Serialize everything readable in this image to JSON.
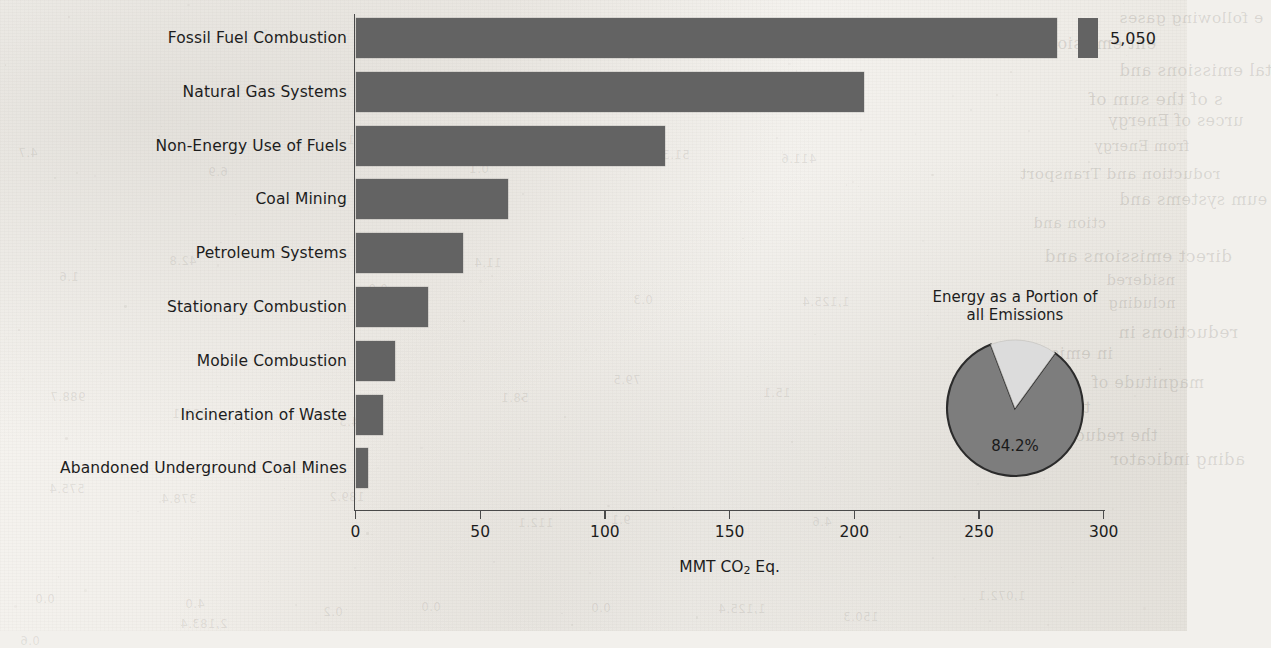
{
  "chart_data": {
    "type": "bar",
    "title": "",
    "orientation": "horizontal",
    "xlabel": "MMT CO2 Eq.",
    "xlabel_parts": {
      "pre": "MMT CO",
      "sub": "2",
      "post": " Eq."
    },
    "ylabel": "",
    "xlim": [
      0,
      300
    ],
    "xticks": [
      0,
      50,
      100,
      150,
      200,
      250,
      300
    ],
    "xtick_labels": [
      "0",
      "50",
      "100",
      "150",
      "200",
      "250",
      "300"
    ],
    "grid": false,
    "legend": "none",
    "bar_color": "#636363",
    "categories": [
      "Fossil Fuel Combustion",
      "Natural Gas Systems",
      "Non-Energy Use of Fuels",
      "Coal Mining",
      "Petroleum Systems",
      "Stationary Combustion",
      "Mobile Combustion",
      "Incineration of Waste",
      "Abandoned Underground Coal Mines"
    ],
    "values": [
      5050,
      204,
      124,
      61,
      43,
      29,
      16,
      11,
      5
    ],
    "axis_broken": true,
    "broken_bar_index": 0,
    "value_labels": [
      {
        "category": "Fossil Fuel Combustion",
        "label": "5,050"
      }
    ]
  },
  "inset_pie": {
    "type": "pie",
    "title_line1": "Energy as a Portion of",
    "title_line2": "all Emissions",
    "slices": [
      {
        "name": "Energy",
        "value": 84.2,
        "label": "84.2%",
        "color": "#7d7d7d"
      },
      {
        "name": "Other",
        "value": 15.8,
        "label": "",
        "color": "#dcdcdc"
      }
    ],
    "start_angle_deg": -54,
    "outline_color": "#2b2b2b"
  },
  "ghost_text": {
    "lines": [
      "e following gases",
      "ent emissions",
      "tal emissions and",
      "s of the sum of",
      "urces of Energy",
      "from Energy",
      "roduction and Transport",
      "eum systems and",
      "ction and",
      "direct emissions and",
      "nsidered",
      "ncluding",
      "reductions in",
      "in emission",
      "magnitude of",
      "tion, with",
      "the reductions",
      "ading indicator"
    ],
    "numbers": [
      "4.7",
      "6.9",
      "8.1",
      "0.1",
      "51.3",
      "411.6",
      "1.6",
      "42.8",
      "0.9",
      "11.4",
      "0.3",
      "1,125.4",
      "988.7",
      "229.1",
      "104.3",
      "58.1",
      "79.5",
      "15.1",
      "575.4",
      "378.4",
      "189.2",
      "112.1",
      "9.1",
      "4.6",
      "0.6",
      "2,183.4"
    ]
  }
}
